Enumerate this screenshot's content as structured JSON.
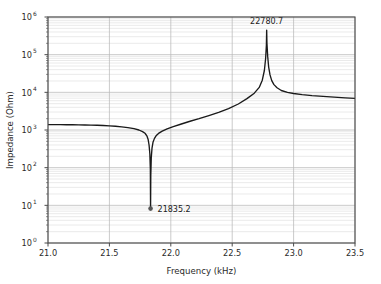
{
  "chart_data": {
    "type": "line",
    "title": "",
    "xlabel": "Frequency (kHz)",
    "ylabel": "Impedance (Ohm)",
    "xlim": [
      21.0,
      23.5
    ],
    "ylim": [
      1,
      1000000
    ],
    "yscale": "log",
    "xscale": "linear",
    "grid": true,
    "grid_minor": true,
    "legend": "none",
    "x_ticks": [
      "21.0",
      "21.5",
      "22.0",
      "22.5",
      "23.0",
      "23.5"
    ],
    "x_tick_values": [
      21.0,
      21.5,
      22.0,
      22.5,
      23.0,
      23.5
    ],
    "y_ticks": [
      "10^0",
      "10^1",
      "10^2",
      "10^3",
      "10^4",
      "10^5",
      "10^6"
    ],
    "y_tick_exponents": [
      "0",
      "1",
      "2",
      "3",
      "4",
      "5",
      "6"
    ],
    "y_tick_base": "10",
    "series": [
      {
        "name": "impedance",
        "color": "#1a1a1a",
        "x": [
          21.0,
          21.05,
          21.1,
          21.15,
          21.2,
          21.25,
          21.3,
          21.35,
          21.4,
          21.45,
          21.5,
          21.55,
          21.6,
          21.65,
          21.7,
          21.74,
          21.77,
          21.79,
          21.805,
          21.815,
          21.823,
          21.8295,
          21.8335,
          21.8352,
          21.837,
          21.841,
          21.847,
          21.855,
          21.867,
          21.88,
          21.9,
          21.93,
          21.97,
          22.02,
          22.08,
          22.15,
          22.23,
          22.31,
          22.39,
          22.47,
          22.55,
          22.62,
          22.68,
          22.72,
          22.745,
          22.762,
          22.772,
          22.7785,
          22.7807,
          22.783,
          22.789,
          22.797,
          22.808,
          22.822,
          22.84,
          22.865,
          22.9,
          22.95,
          23.0,
          23.07,
          23.15,
          23.24,
          23.33,
          23.42,
          23.5
        ],
        "y": [
          1390,
          1388,
          1385,
          1381,
          1376,
          1369,
          1360,
          1349,
          1334,
          1315,
          1290,
          1258,
          1216,
          1160,
          1082,
          1000,
          905,
          820,
          700,
          570,
          400,
          230,
          90,
          8.2,
          60,
          180,
          330,
          470,
          600,
          700,
          810,
          930,
          1070,
          1230,
          1420,
          1680,
          2000,
          2420,
          2950,
          3700,
          4900,
          6800,
          9500,
          13500,
          21000,
          38000,
          78000,
          180000,
          450000,
          200000,
          90000,
          47000,
          29000,
          20500,
          16000,
          13200,
          11200,
          10000,
          9300,
          8700,
          8200,
          7800,
          7450,
          7150,
          6900
        ]
      }
    ],
    "annotations": [
      {
        "name": "resonance-minimum",
        "label": "21835.2",
        "x": 21.8352,
        "y": 8.2,
        "marker": "dot",
        "marker_color": "#555555",
        "text_anchor": "start",
        "text_dx": 7,
        "text_dy": 3
      },
      {
        "name": "antiresonance-maximum",
        "label": "22780.7",
        "x": 22.7807,
        "y": 450000,
        "marker": "none",
        "marker_color": "#555555",
        "text_anchor": "middle",
        "text_dx": 0,
        "text_dy": -6
      }
    ],
    "colors": {
      "line": "#1a1a1a",
      "grid_major": "#b8b8b8",
      "grid_minor": "#d8d8d8",
      "axis": "#4a4a4a",
      "background": "#ffffff",
      "text": "#2b2b2b"
    }
  }
}
